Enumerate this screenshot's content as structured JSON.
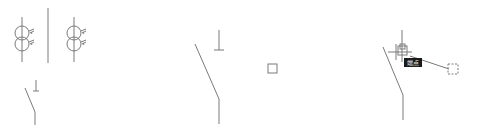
{
  "drawing": {
    "stroke_color": "#7a7a7a",
    "background": "#ffffff",
    "panels": [
      {
        "name": "left",
        "symbols": [
          "transformer",
          "divider-line",
          "transformer",
          "disconnector-switch"
        ]
      },
      {
        "name": "middle",
        "symbols": [
          "disconnector-switch",
          "grip-square"
        ]
      },
      {
        "name": "right",
        "symbols": [
          "disconnector-switch",
          "crosshair-cursor",
          "snap-marker",
          "snap-tooltip",
          "rubber-band-line",
          "dashed-grip-square"
        ]
      }
    ]
  },
  "snap_tooltip": {
    "label": "端点",
    "background": "#1a1a1a",
    "text_color": "#e8e8e8"
  }
}
